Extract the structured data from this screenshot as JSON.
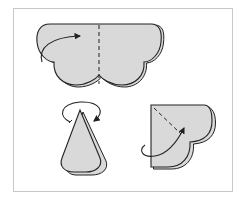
{
  "diagram": {
    "type": "folding-instructions",
    "steps": [
      {
        "id": "step-1",
        "shape": "scalloped-cloud",
        "fold_line": "vertical-dashed-center",
        "arrow": "fold-left-to-right"
      },
      {
        "id": "step-2",
        "shape": "cone",
        "arrow": "rotate-around"
      },
      {
        "id": "step-3",
        "shape": "quarter-heart",
        "fold_line": "diagonal-dashed",
        "arrow": "fold-behind"
      }
    ],
    "colors": {
      "fill": "#d9d9d9",
      "stroke": "#222222",
      "frame": "#c8c8c8",
      "background": "#ffffff"
    }
  }
}
